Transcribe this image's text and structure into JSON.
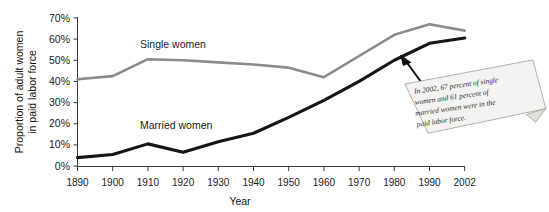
{
  "chart_data": {
    "type": "line",
    "title": "",
    "subtitle": "",
    "xlabel": "Year",
    "ylabel": "Proportion of adult women in paid labor force",
    "ylabel_line1": "Proportion of adult women",
    "ylabel_line2": "in paid labor force",
    "grid": false,
    "legend_position": "inline-labels",
    "xlim": [
      1890,
      2002
    ],
    "ylim": [
      0,
      70
    ],
    "x_tick_labels": [
      "1890",
      "1900",
      "1910",
      "1920",
      "1930",
      "1940",
      "1950",
      "1960",
      "1970",
      "1980",
      "1990",
      "2002"
    ],
    "x": [
      1890,
      1900,
      1910,
      1920,
      1930,
      1940,
      1950,
      1960,
      1970,
      1980,
      1990,
      2002
    ],
    "y_tick_labels": [
      "0%",
      "10%",
      "20%",
      "30%",
      "40%",
      "50%",
      "60%",
      "70%"
    ],
    "y_ticks": [
      0,
      10,
      20,
      30,
      40,
      50,
      60,
      70
    ],
    "series": [
      {
        "name": "Single women",
        "color": "#8c8c8c",
        "values": [
          41,
          42.5,
          50.5,
          50,
          49,
          48,
          46.5,
          42,
          52,
          62,
          67,
          64
        ]
      },
      {
        "name": "Married women",
        "color": "#151515",
        "values": [
          4,
          5.5,
          10.5,
          6.5,
          11.5,
          15.5,
          23,
          31,
          40,
          50,
          58,
          60.5
        ]
      }
    ],
    "annotations": [
      {
        "id": "note-2002",
        "text": "In 2002, 67 percent of single women and 61 percent of married women were in the paid labor force.",
        "lines": [
          "In 2002, 67 percent of single",
          "women and 61 percent of",
          "married women were in the",
          "paid labor force."
        ],
        "arrow_target_year": 2002,
        "arrow_target_value": 60.5
      }
    ],
    "colors": {
      "single_women": "#8c8c8c",
      "married_women": "#151515",
      "axis": "#3a3a3a",
      "background": "#ffffff",
      "note_paper": "#f4f3f1"
    }
  }
}
